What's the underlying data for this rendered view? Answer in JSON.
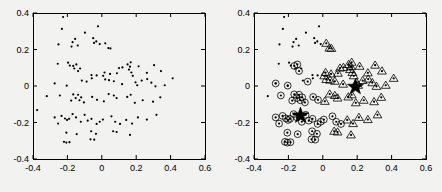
{
  "figure": {
    "background": "#f2f2f0",
    "axis_color": "#000000",
    "marker_color": "#000000",
    "panels": [
      {
        "name": "unclustered-scatter",
        "title": "",
        "box": {
          "x": 33,
          "y": 13,
          "w": 172,
          "h": 146
        }
      },
      {
        "name": "clustered-scatter",
        "title": "",
        "box": {
          "x": 254,
          "y": 13,
          "w": 172,
          "h": 146
        }
      }
    ]
  },
  "axes": {
    "xlabel": "",
    "ylabel": "",
    "xlim": [
      -0.4,
      0.6
    ],
    "ylim": [
      -0.4,
      0.4
    ],
    "xticks": [
      -0.4,
      -0.2,
      0,
      0.2,
      0.4,
      0.6
    ],
    "yticks": [
      -0.4,
      -0.2,
      0,
      0.2,
      0.4
    ],
    "xticklabels": [
      "-0.4",
      "-0.2",
      "0",
      "0.2",
      "0.4",
      "0.6"
    ],
    "yticklabels": [
      "-0.4",
      "-0.2",
      "0",
      "0.2",
      "0.4"
    ],
    "grid": false,
    "legend": null
  },
  "chart_data": [
    {
      "type": "scatter",
      "name": "left-panel-raw-points",
      "title": "",
      "xlabel": "",
      "ylabel": "",
      "xlim": [
        -0.4,
        0.6
      ],
      "ylim": [
        -0.4,
        0.4
      ],
      "grid": false,
      "legend": null,
      "series": [
        {
          "name": "points",
          "marker": "dot",
          "color": "#000000",
          "points": [
            [
              -0.225,
              0.378
            ],
            [
              -0.232,
              0.313
            ],
            [
              -0.098,
              0.292
            ],
            [
              -0.155,
              0.258
            ],
            [
              -0.022,
              0.327
            ],
            [
              -0.252,
              0.228
            ],
            [
              -0.17,
              0.24
            ],
            [
              -0.176,
              0.216
            ],
            [
              -0.14,
              0.222
            ],
            [
              -0.05,
              0.262
            ],
            [
              -0.045,
              0.236
            ],
            [
              -0.032,
              0.244
            ],
            [
              -0.012,
              0.23
            ],
            [
              0.02,
              0.234
            ],
            [
              0.038,
              0.208
            ],
            [
              0.05,
              0.206
            ],
            [
              -0.256,
              0.122
            ],
            [
              -0.196,
              0.128
            ],
            [
              -0.186,
              0.112
            ],
            [
              -0.166,
              0.11
            ],
            [
              -0.16,
              0.096
            ],
            [
              -0.148,
              0.118
            ],
            [
              -0.138,
              0.082
            ],
            [
              -0.126,
              0.096
            ],
            [
              -0.06,
              0.06
            ],
            [
              -0.03,
              0.058
            ],
            [
              0.008,
              0.056
            ],
            [
              0.016,
              0.074
            ],
            [
              0.048,
              0.066
            ],
            [
              0.088,
              0.07
            ],
            [
              0.1,
              0.098
            ],
            [
              0.12,
              0.102
            ],
            [
              0.15,
              0.118
            ],
            [
              0.158,
              0.09
            ],
            [
              0.164,
              0.106
            ],
            [
              0.168,
              0.13
            ],
            [
              0.172,
              0.074
            ],
            [
              0.18,
              0.056
            ],
            [
              0.214,
              0.108
            ],
            [
              0.262,
              0.072
            ],
            [
              0.304,
              0.114
            ],
            [
              0.344,
              0.082
            ],
            [
              -0.274,
              0.014
            ],
            [
              -0.204,
              0.002
            ],
            [
              -0.116,
              0.03
            ],
            [
              -0.088,
              0.024
            ],
            [
              -0.058,
              0.042
            ],
            [
              0.02,
              0.036
            ],
            [
              0.042,
              0.032
            ],
            [
              0.07,
              0.026
            ],
            [
              0.118,
              0.01
            ],
            [
              0.196,
              0.02
            ],
            [
              0.206,
              0.004
            ],
            [
              0.232,
              0.03
            ],
            [
              0.264,
              0.038
            ],
            [
              0.288,
              0.018
            ],
            [
              0.312,
              -0.002
            ],
            [
              0.366,
              0.004
            ],
            [
              0.412,
              0.042
            ],
            [
              -0.32,
              -0.056
            ],
            [
              -0.244,
              -0.052
            ],
            [
              -0.178,
              -0.08
            ],
            [
              -0.166,
              -0.046
            ],
            [
              -0.152,
              -0.066
            ],
            [
              -0.138,
              -0.048
            ],
            [
              -0.13,
              -0.078
            ],
            [
              -0.12,
              -0.062
            ],
            [
              -0.104,
              -0.09
            ],
            [
              -0.056,
              -0.06
            ],
            [
              -0.028,
              -0.076
            ],
            [
              0.012,
              -0.084
            ],
            [
              0.04,
              -0.044
            ],
            [
              0.07,
              -0.052
            ],
            [
              0.086,
              -0.066
            ],
            [
              0.148,
              -0.06
            ],
            [
              0.168,
              -0.048
            ],
            [
              0.192,
              -0.092
            ],
            [
              0.238,
              -0.078
            ],
            [
              0.298,
              -0.086
            ],
            [
              0.34,
              -0.062
            ],
            [
              -0.376,
              -0.132
            ],
            [
              -0.274,
              -0.172
            ],
            [
              -0.254,
              -0.206
            ],
            [
              -0.234,
              -0.164
            ],
            [
              -0.214,
              -0.178
            ],
            [
              -0.202,
              -0.186
            ],
            [
              -0.19,
              -0.18
            ],
            [
              -0.17,
              -0.154
            ],
            [
              -0.15,
              -0.172
            ],
            [
              -0.122,
              -0.196
            ],
            [
              -0.1,
              -0.158
            ],
            [
              -0.082,
              -0.19
            ],
            [
              -0.06,
              -0.18
            ],
            [
              -0.03,
              -0.208
            ],
            [
              -0.012,
              -0.196
            ],
            [
              0.006,
              -0.184
            ],
            [
              0.056,
              -0.166
            ],
            [
              0.078,
              -0.196
            ],
            [
              0.106,
              -0.208
            ],
            [
              0.142,
              -0.186
            ],
            [
              0.176,
              -0.206
            ],
            [
              0.21,
              -0.172
            ],
            [
              0.262,
              -0.184
            ],
            [
              0.318,
              -0.158
            ],
            [
              -0.206,
              -0.256
            ],
            [
              -0.146,
              -0.264
            ],
            [
              -0.062,
              -0.248
            ],
            [
              -0.034,
              -0.262
            ],
            [
              0.066,
              -0.248
            ],
            [
              0.086,
              -0.252
            ],
            [
              0.164,
              -0.268
            ],
            [
              -0.22,
              -0.306
            ],
            [
              -0.206,
              -0.31
            ],
            [
              -0.188,
              -0.308
            ],
            [
              -0.066,
              -0.292
            ],
            [
              -0.044,
              -0.294
            ]
          ]
        }
      ]
    },
    {
      "type": "scatter",
      "name": "right-panel-clustered-points",
      "title": "",
      "xlabel": "",
      "ylabel": "",
      "xlim": [
        -0.4,
        0.6
      ],
      "ylim": [
        -0.4,
        0.4
      ],
      "grid": false,
      "legend": null,
      "series": [
        {
          "name": "unassigned-points",
          "marker": "dot",
          "color": "#000000",
          "points": [
            [
              -0.225,
              0.378
            ],
            [
              -0.232,
              0.313
            ],
            [
              -0.098,
              0.292
            ],
            [
              -0.155,
              0.258
            ],
            [
              -0.022,
              0.327
            ],
            [
              -0.252,
              0.228
            ],
            [
              -0.17,
              0.24
            ],
            [
              -0.176,
              0.216
            ],
            [
              -0.14,
              0.222
            ],
            [
              -0.05,
              0.262
            ],
            [
              -0.045,
              0.236
            ],
            [
              -0.032,
              0.244
            ],
            [
              -0.012,
              0.23
            ],
            [
              -0.256,
              0.122
            ],
            [
              -0.196,
              0.128
            ],
            [
              -0.186,
              0.112
            ],
            [
              -0.16,
              0.096
            ],
            [
              -0.126,
              0.096
            ],
            [
              -0.06,
              0.06
            ],
            [
              -0.03,
              0.058
            ],
            [
              -0.274,
              0.014
            ],
            [
              -0.204,
              0.002
            ],
            [
              -0.116,
              0.03
            ],
            [
              -0.058,
              0.042
            ],
            [
              -0.32,
              -0.056
            ]
          ]
        },
        {
          "name": "cluster-1-circle",
          "marker": "circle",
          "color": "#000000",
          "points": [
            [
              -0.166,
              0.11
            ],
            [
              -0.148,
              0.118
            ],
            [
              -0.138,
              0.082
            ],
            [
              -0.274,
              0.014
            ],
            [
              -0.244,
              -0.052
            ],
            [
              -0.204,
              0.002
            ],
            [
              -0.178,
              -0.08
            ],
            [
              -0.166,
              -0.046
            ],
            [
              -0.152,
              -0.066
            ],
            [
              -0.138,
              -0.048
            ],
            [
              -0.13,
              -0.078
            ],
            [
              -0.12,
              -0.062
            ],
            [
              -0.104,
              -0.09
            ],
            [
              -0.056,
              -0.06
            ],
            [
              -0.274,
              -0.172
            ],
            [
              -0.254,
              -0.206
            ],
            [
              -0.234,
              -0.164
            ],
            [
              -0.214,
              -0.178
            ],
            [
              -0.202,
              -0.186
            ],
            [
              -0.19,
              -0.18
            ],
            [
              -0.17,
              -0.154
            ],
            [
              -0.15,
              -0.172
            ],
            [
              -0.122,
              -0.196
            ],
            [
              -0.1,
              -0.158
            ],
            [
              -0.082,
              -0.19
            ],
            [
              -0.06,
              -0.18
            ],
            [
              -0.03,
              -0.208
            ],
            [
              -0.012,
              -0.196
            ],
            [
              -0.206,
              -0.256
            ],
            [
              -0.146,
              -0.264
            ],
            [
              -0.062,
              -0.248
            ],
            [
              -0.034,
              -0.262
            ],
            [
              -0.22,
              -0.306
            ],
            [
              -0.206,
              -0.31
            ],
            [
              -0.188,
              -0.308
            ],
            [
              -0.066,
              -0.292
            ],
            [
              -0.044,
              -0.294
            ],
            [
              0.006,
              -0.184
            ],
            [
              0.056,
              -0.166
            ],
            [
              0.078,
              -0.196
            ],
            [
              0.106,
              -0.208
            ],
            [
              -0.028,
              -0.076
            ],
            [
              -0.088,
              0.024
            ]
          ]
        },
        {
          "name": "cluster-2-triangle",
          "marker": "triangle",
          "color": "#000000",
          "points": [
            [
              0.02,
              0.234
            ],
            [
              0.038,
              0.208
            ],
            [
              0.05,
              0.206
            ],
            [
              0.008,
              0.056
            ],
            [
              0.016,
              0.074
            ],
            [
              0.048,
              0.066
            ],
            [
              0.088,
              0.07
            ],
            [
              0.1,
              0.098
            ],
            [
              0.12,
              0.102
            ],
            [
              0.15,
              0.118
            ],
            [
              0.158,
              0.09
            ],
            [
              0.164,
              0.106
            ],
            [
              0.168,
              0.13
            ],
            [
              0.172,
              0.074
            ],
            [
              0.18,
              0.056
            ],
            [
              0.214,
              0.108
            ],
            [
              0.262,
              0.072
            ],
            [
              0.304,
              0.114
            ],
            [
              0.344,
              0.082
            ],
            [
              0.02,
              0.036
            ],
            [
              0.042,
              0.032
            ],
            [
              0.07,
              0.026
            ],
            [
              0.118,
              0.01
            ],
            [
              0.196,
              0.02
            ],
            [
              0.206,
              0.004
            ],
            [
              0.232,
              0.03
            ],
            [
              0.264,
              0.038
            ],
            [
              0.288,
              0.018
            ],
            [
              0.312,
              -0.002
            ],
            [
              0.366,
              0.004
            ],
            [
              0.412,
              0.042
            ],
            [
              0.012,
              -0.084
            ],
            [
              0.04,
              -0.044
            ],
            [
              0.07,
              -0.052
            ],
            [
              0.086,
              -0.066
            ],
            [
              0.148,
              -0.06
            ],
            [
              0.168,
              -0.048
            ],
            [
              0.192,
              -0.092
            ],
            [
              0.238,
              -0.078
            ],
            [
              0.298,
              -0.086
            ],
            [
              0.34,
              -0.062
            ],
            [
              0.142,
              -0.186
            ],
            [
              0.176,
              -0.206
            ],
            [
              0.21,
              -0.172
            ],
            [
              0.262,
              -0.184
            ],
            [
              0.318,
              -0.158
            ],
            [
              0.086,
              -0.252
            ],
            [
              0.164,
              -0.268
            ],
            [
              0.066,
              -0.248
            ]
          ]
        },
        {
          "name": "centroids",
          "marker": "star",
          "color": "#000000",
          "points": [
            [
              -0.13,
              -0.162
            ],
            [
              0.19,
              -0.005
            ]
          ]
        }
      ]
    }
  ]
}
